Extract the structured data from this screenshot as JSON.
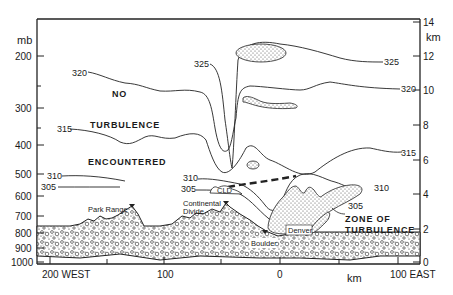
{
  "figure": {
    "type": "cross-section",
    "left_axis": {
      "unit": "mb",
      "ticks": [
        "200",
        "300",
        "400",
        "500",
        "600",
        "700",
        "800",
        "900",
        "1000"
      ]
    },
    "right_axis": {
      "unit": "km",
      "ticks": [
        "14",
        "12",
        "10",
        "8",
        "6",
        "4",
        "2",
        "0"
      ]
    },
    "bottom_axis": {
      "unit": "km",
      "ticks": [
        "200 WEST",
        "100",
        "0",
        "100 EAST"
      ]
    },
    "isentropes": {
      "left": [
        "320",
        "315",
        "310",
        "305"
      ],
      "center": [
        "325",
        "310",
        "305"
      ],
      "right": [
        "325",
        "320",
        "315",
        "310",
        "305"
      ]
    },
    "annotations": {
      "no": "NO",
      "turbulence": "TURBULENCE",
      "encountered": "ENCOUNTERED",
      "zone_line1": "ZONE OF",
      "zone_line2": "TURBULENCE",
      "cloud": "CLD"
    },
    "places": {
      "park_range": "Park Range",
      "continental_line1": "Continental",
      "continental_line2": "Divide",
      "boulder": "Boulder",
      "denver": "Denver"
    }
  }
}
